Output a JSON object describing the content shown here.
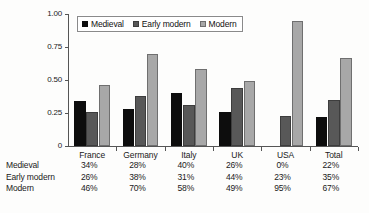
{
  "chart_data": {
    "type": "bar",
    "title": "",
    "xlabel": "",
    "ylabel": "",
    "ylim": [
      0,
      1.0
    ],
    "ytick_labels": [
      "0",
      "0.25",
      "0.50",
      "0.75",
      "1.00"
    ],
    "ytick_values": [
      0,
      0.25,
      0.5,
      0.75,
      1.0
    ],
    "grid": false,
    "legend_position": "top-left-inside",
    "categories": [
      "France",
      "Germany",
      "Italy",
      "UK",
      "USA",
      "Total"
    ],
    "series": [
      {
        "name": "Medieval",
        "color": "#0d0d0d",
        "values": [
          0.34,
          0.28,
          0.4,
          0.26,
          0.0,
          0.22
        ]
      },
      {
        "name": "Early modern",
        "color": "#585858",
        "values": [
          0.26,
          0.38,
          0.31,
          0.44,
          0.23,
          0.35
        ]
      },
      {
        "name": "Modern",
        "color": "#a8a8a8",
        "values": [
          0.46,
          0.7,
          0.58,
          0.49,
          0.95,
          0.67
        ]
      }
    ],
    "data_table": {
      "row_labels": [
        "Medieval",
        "Early modern",
        "Modern"
      ],
      "column_headers": [
        "France",
        "Germany",
        "Italy",
        "UK",
        "USA",
        "Total"
      ],
      "rows": [
        [
          "34%",
          "28%",
          "40%",
          "26%",
          "0%",
          "22%"
        ],
        [
          "26%",
          "38%",
          "31%",
          "44%",
          "23%",
          "35%"
        ],
        [
          "46%",
          "70%",
          "58%",
          "49%",
          "95%",
          "67%"
        ]
      ]
    }
  },
  "legend": {
    "items": [
      {
        "label": "Medieval"
      },
      {
        "label": "Early modern"
      },
      {
        "label": "Modern"
      }
    ]
  }
}
